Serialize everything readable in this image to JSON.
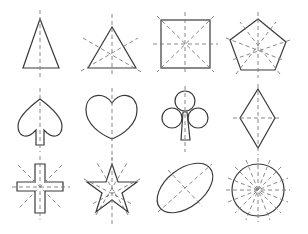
{
  "diagram": {
    "stroke_color": "#3a3a3a",
    "axis_color": "#7a7a7a",
    "background": "#ffffff",
    "shapes": [
      {
        "name": "isosceles-triangle",
        "row": 1,
        "col": 1,
        "symmetry_lines": 1
      },
      {
        "name": "equilateral-triangle",
        "row": 1,
        "col": 2,
        "symmetry_lines": 3
      },
      {
        "name": "square",
        "row": 1,
        "col": 3,
        "symmetry_lines": 4
      },
      {
        "name": "regular-pentagon",
        "row": 1,
        "col": 4,
        "symmetry_lines": 5
      },
      {
        "name": "spade",
        "row": 2,
        "col": 1,
        "symmetry_lines": 1
      },
      {
        "name": "heart",
        "row": 2,
        "col": 2,
        "symmetry_lines": 1
      },
      {
        "name": "club",
        "row": 2,
        "col": 3,
        "symmetry_lines": 1
      },
      {
        "name": "rhombus",
        "row": 2,
        "col": 4,
        "symmetry_lines": 2
      },
      {
        "name": "cross",
        "row": 3,
        "col": 1,
        "symmetry_lines": 4
      },
      {
        "name": "five-pointed-star",
        "row": 3,
        "col": 2,
        "symmetry_lines": 5
      },
      {
        "name": "ellipse",
        "row": 3,
        "col": 3,
        "symmetry_lines": 2
      },
      {
        "name": "circle",
        "row": 3,
        "col": 4,
        "symmetry_lines": "infinite"
      }
    ]
  }
}
